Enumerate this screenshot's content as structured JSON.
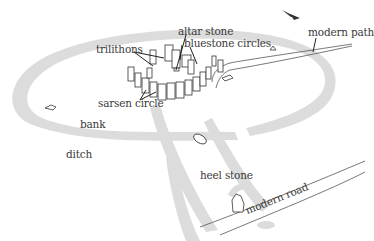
{
  "diagram": {
    "labels": {
      "trilithons": "trilithons",
      "altar_stone": "altar stone",
      "bluestone_circles": "bluestone circles",
      "modern_path": "modern path",
      "sarsen_circle": "sarsen circle",
      "bank": "bank",
      "ditch": "ditch",
      "heel_stone": "heel stone",
      "modern_road": "modern road"
    },
    "colors": {
      "earthwork": "#dcdcdc",
      "ink": "#333333",
      "background": "#ffffff"
    },
    "icons": [
      "north-arrow-icon"
    ]
  }
}
